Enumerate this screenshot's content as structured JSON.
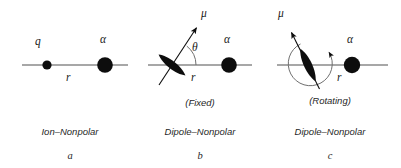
{
  "figure": {
    "width": 401,
    "height": 168,
    "background": "#ffffff",
    "axis_color": "#8a8a8a",
    "ink_color": "#0d0d0d"
  },
  "panels": [
    {
      "id": "a",
      "letter": "a",
      "caption": "Ion–Nonpolar",
      "state_note": "",
      "axis": {
        "x1": 22,
        "x2": 128,
        "y": 65
      },
      "labels": {
        "left_particle": "q",
        "right_particle": "α",
        "distance": "r"
      },
      "left_particle": {
        "cx": 47,
        "cy": 65,
        "r": 4.6,
        "type": "ion-dot"
      },
      "right_particle": {
        "cx": 105,
        "cy": 65,
        "r": 7.8,
        "type": "nonpolar-sphere"
      },
      "caption_center_x": 70,
      "letter_center_x": 70
    },
    {
      "id": "b",
      "letter": "b",
      "caption": "Dipole–Nonpolar",
      "state_note": "(Fixed)",
      "axis": {
        "x1": 148,
        "x2": 252,
        "y": 65
      },
      "labels": {
        "moment": "μ",
        "angle": "θ",
        "right_particle": "α",
        "distance": "r"
      },
      "dipole": {
        "cx": 172,
        "cy": 65,
        "length": 34,
        "width": 9,
        "angle_deg": 52
      },
      "moment_arrow": {
        "x1": 160,
        "y1": 84,
        "x2": 197,
        "y2": 27,
        "angle_deg": 52
      },
      "angle_arc": {
        "cx": 172,
        "cy": 65,
        "r": 24,
        "from_deg": 0,
        "to_deg": 52
      },
      "right_particle": {
        "cx": 229,
        "cy": 65,
        "r": 7.8,
        "type": "nonpolar-sphere"
      },
      "caption_center_x": 200,
      "letter_center_x": 200
    },
    {
      "id": "c",
      "letter": "c",
      "caption": "Dipole–Nonpolar",
      "state_note": "(Rotating)",
      "axis": {
        "x1": 277,
        "x2": 388,
        "y": 65
      },
      "labels": {
        "moment": "μ",
        "right_particle": "α",
        "distance": "r"
      },
      "dipole": {
        "cx": 308,
        "cy": 65,
        "length": 36,
        "width": 9,
        "angle_deg": 115
      },
      "moment_arrow": {
        "x1": 318,
        "y1": 88,
        "x2": 291,
        "y2": 32,
        "angle_deg": 115
      },
      "rotation_arc": {
        "cx": 308,
        "cy": 65,
        "r": 22,
        "open_top": true,
        "arrow_at": "top-right"
      },
      "right_particle": {
        "cx": 352,
        "cy": 65,
        "r": 8.2,
        "type": "nonpolar-sphere"
      },
      "caption_center_x": 330,
      "letter_center_x": 330
    }
  ],
  "text_positions": {
    "a_q": {
      "x": 35,
      "y": 36
    },
    "a_alpha": {
      "x": 100,
      "y": 34
    },
    "a_r": {
      "x": 66,
      "y": 72
    },
    "b_mu": {
      "x": 201,
      "y": 8
    },
    "b_theta": {
      "x": 192,
      "y": 42
    },
    "b_alpha": {
      "x": 224,
      "y": 34
    },
    "b_r": {
      "x": 191,
      "y": 72
    },
    "c_mu": {
      "x": 278,
      "y": 8
    },
    "c_alpha": {
      "x": 347,
      "y": 34
    },
    "c_r": {
      "x": 337,
      "y": 72
    },
    "caption_y": 127,
    "letter_y": 151,
    "note_y": 98
  }
}
